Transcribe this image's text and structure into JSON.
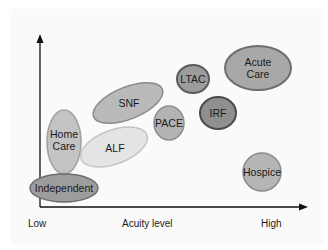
{
  "diagram": {
    "x_axis": {
      "label": "Acuity level",
      "low": "Low",
      "high": "High"
    },
    "nodes": [
      {
        "id": "snf",
        "label1": "SNF",
        "label2": "",
        "fill": "#b9b9b9",
        "stroke": "#8a8a8a"
      },
      {
        "id": "ltac",
        "label1": "LTAC",
        "label2": "",
        "fill": "#9c9c9c",
        "stroke": "#5a5a5a"
      },
      {
        "id": "acute-care",
        "label1": "Acute",
        "label2": "Care",
        "fill": "#a8a8a8",
        "stroke": "#6e6e6e"
      },
      {
        "id": "irf",
        "label1": "IRF",
        "label2": "",
        "fill": "#8f8f8f",
        "stroke": "#4a4a4a"
      },
      {
        "id": "pace",
        "label1": "PACE",
        "label2": "",
        "fill": "#b3b3b3",
        "stroke": "#8e8e8e"
      },
      {
        "id": "home-care",
        "label1": "Home",
        "label2": "Care",
        "fill": "#c3c3c3",
        "stroke": "#a0a0a0"
      },
      {
        "id": "alf",
        "label1": "ALF",
        "label2": "",
        "fill": "#e4e4e4",
        "stroke": "#c4c4c4"
      },
      {
        "id": "independent",
        "label1": "Independent",
        "label2": "",
        "fill": "#9d9d9d",
        "stroke": "#6c6c6c"
      },
      {
        "id": "hospice",
        "label1": "Hospice",
        "label2": "",
        "fill": "#b5b5b5",
        "stroke": "#8a8a8a"
      }
    ]
  }
}
